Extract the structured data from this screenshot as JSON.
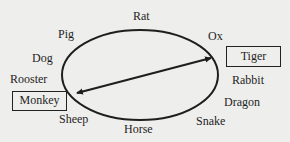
{
  "diagram": {
    "title": "",
    "ellipse_labels": [
      {
        "id": "rat",
        "text": "Rat"
      },
      {
        "id": "ox",
        "text": "Ox"
      },
      {
        "id": "tiger",
        "text": "Tiger",
        "boxed": true
      },
      {
        "id": "rabbit",
        "text": "Rabbit"
      },
      {
        "id": "dragon",
        "text": "Dragon"
      },
      {
        "id": "snake",
        "text": "Snake"
      },
      {
        "id": "horse",
        "text": "Horse"
      },
      {
        "id": "sheep",
        "text": "Sheep"
      },
      {
        "id": "monkey",
        "text": "Monkey",
        "boxed": true
      },
      {
        "id": "rooster",
        "text": "Rooster"
      },
      {
        "id": "dog",
        "text": "Dog"
      },
      {
        "id": "pig",
        "text": "Pig"
      }
    ],
    "connector": {
      "from": "Monkey",
      "to": "Tiger",
      "type": "double-headed-arrow"
    },
    "colors": {
      "background": "#eeeeec",
      "ink": "#1e1e1e"
    }
  }
}
